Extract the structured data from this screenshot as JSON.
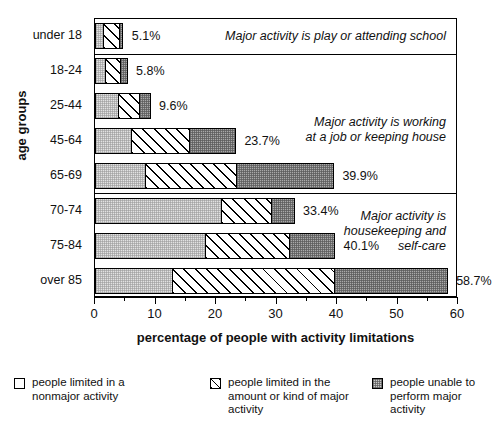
{
  "chart_data": {
    "type": "bar",
    "orientation": "horizontal",
    "stacked": true,
    "title": "",
    "xlabel": "percentage of people with activity limitations",
    "ylabel": "age groups",
    "xlim": [
      0,
      60
    ],
    "xticks": [
      0,
      10,
      20,
      30,
      40,
      50,
      60
    ],
    "xticklabels": [
      "0",
      "10",
      "20",
      "30",
      "40",
      "50",
      "60"
    ],
    "grid": false,
    "legend_position": "bottom",
    "categories": [
      "under 18",
      "18-24",
      "25-44",
      "45-64",
      "65-69",
      "70-74",
      "75-84",
      "over 85"
    ],
    "series": [
      {
        "name": "people limited in a nonmajor activity",
        "fill": "light-stipple",
        "values": [
          1.5,
          1.8,
          4.0,
          6.1,
          8.5,
          21.0,
          18.4,
          12.9
        ]
      },
      {
        "name": "people limited in the amount or kind of major activity",
        "fill": "diagonal-hatch",
        "values": [
          2.9,
          2.8,
          3.6,
          9.8,
          15.2,
          8.5,
          14.1,
          27.0
        ]
      },
      {
        "name": "people unable to perform major activity",
        "fill": "dark-stipple",
        "values": [
          0.7,
          1.2,
          2.0,
          7.8,
          16.2,
          3.9,
          7.6,
          18.8
        ]
      }
    ],
    "totals": [
      5.1,
      5.8,
      9.6,
      23.7,
      39.9,
      33.4,
      40.1,
      58.7
    ],
    "total_labels": [
      "5.1%",
      "5.8%",
      "9.6%",
      "23.7%",
      "39.9%",
      "33.4%",
      "40.1%",
      "58.7%"
    ],
    "annotations": [
      {
        "text": "Major activity is play or attending school",
        "groups": [
          "under 18"
        ]
      },
      {
        "text": "Major activity is working\nat a job or keeping house",
        "groups": [
          "18-24",
          "25-44",
          "45-64",
          "65-69"
        ]
      },
      {
        "text": "Major activity is\nhousekeeping and\nself-care",
        "groups": [
          "70-74",
          "75-84",
          "over 85"
        ]
      }
    ],
    "colors": {
      "nonmajor": "#ffffff",
      "amount_or_kind": "#ffffff",
      "unable": "#a9a9a9",
      "axis": "#000000",
      "background": "#ffffff"
    }
  },
  "legend": {
    "items": [
      {
        "label": "people limited in a\nnonmajor activity",
        "swatch": "s0"
      },
      {
        "label": "people limited in the\namount or kind of major\nactivity",
        "swatch": "s1"
      },
      {
        "label": "people unable to\nperform major activity",
        "swatch": "s2"
      }
    ]
  }
}
